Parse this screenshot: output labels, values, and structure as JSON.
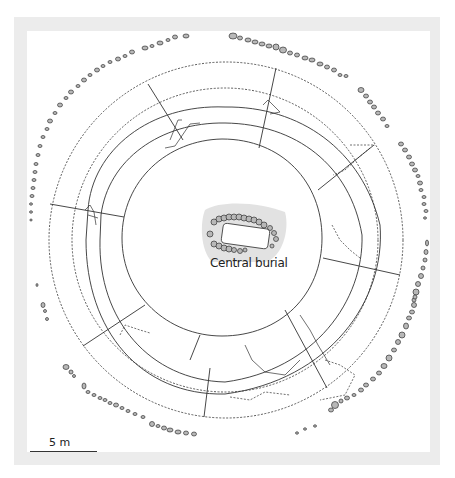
{
  "figure": {
    "type": "archaeological site plan",
    "frame_color": "#ececec",
    "line_color": "#333333",
    "stone_fill": "#b8b8b8",
    "burial_shade": "#e2e2e2"
  },
  "labels": {
    "central_burial": "Central burial",
    "scale": "5 m"
  },
  "plan": {
    "center": [
      224,
      238
    ],
    "rings": [
      {
        "name": "outer-dotted-ring",
        "r": 177,
        "style": "dotted"
      },
      {
        "name": "second-dotted-ring",
        "r": 152,
        "style": "dotted"
      },
      {
        "name": "ditch-outer-edge",
        "r": 136,
        "style": "solid"
      },
      {
        "name": "ditch-inner-edge",
        "r": 120,
        "style": "solid"
      },
      {
        "name": "mound-edge",
        "r": 99,
        "style": "solid"
      }
    ],
    "radial_sections": 8
  }
}
